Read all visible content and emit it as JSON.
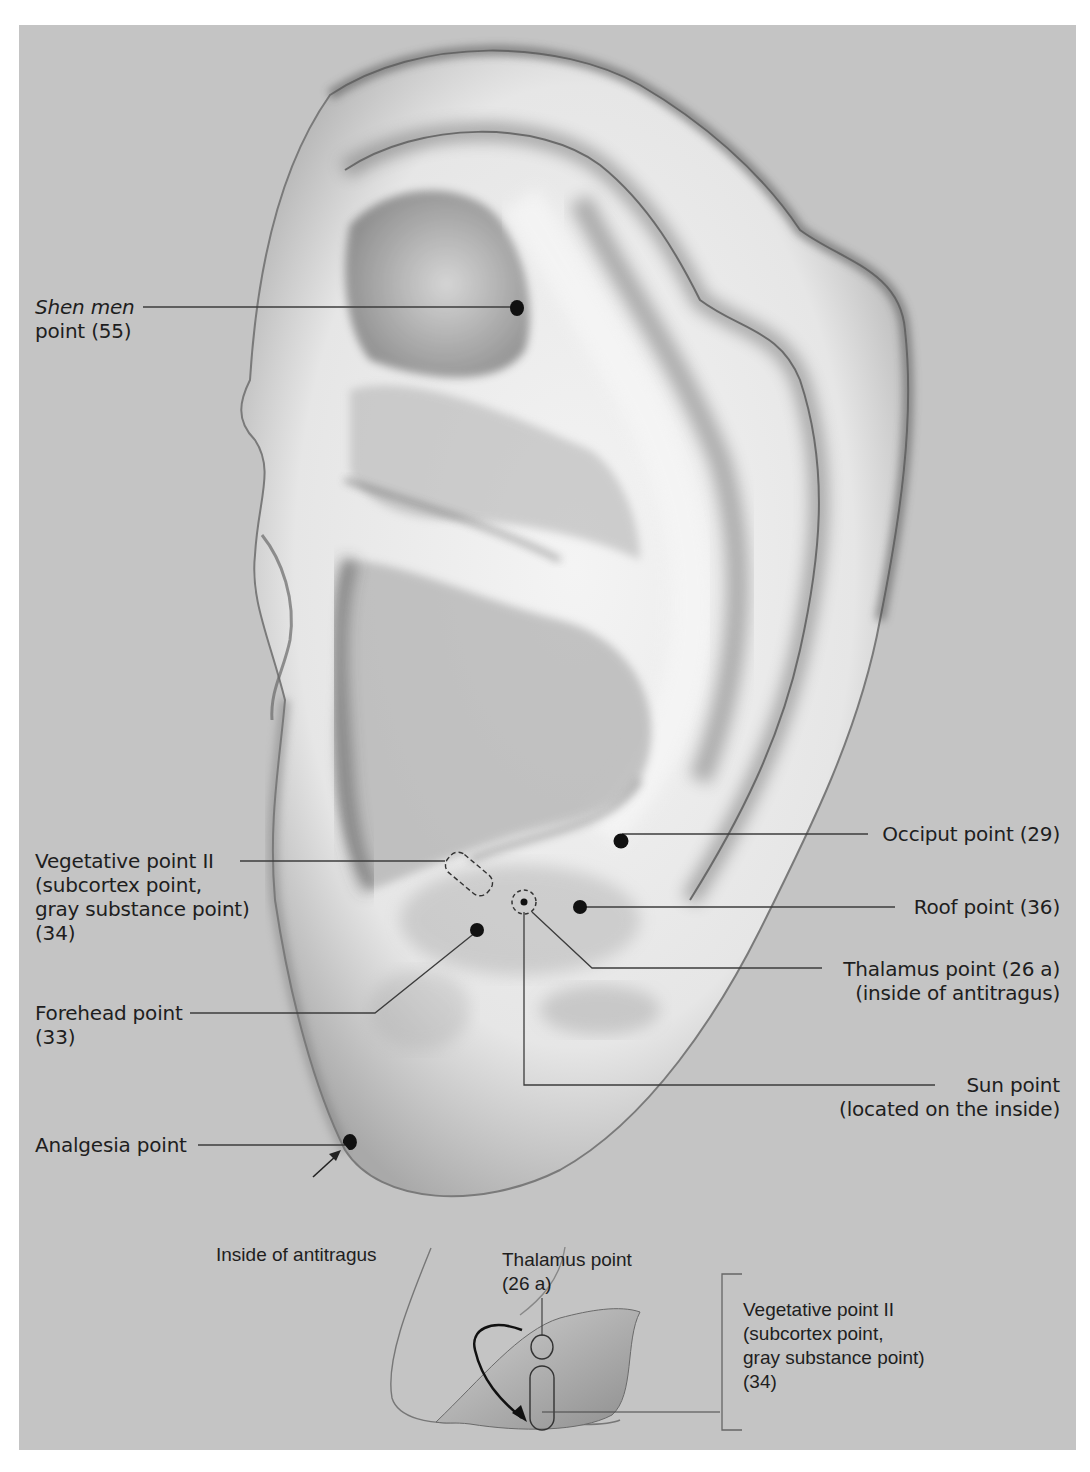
{
  "figure": {
    "background_color": "#c4c4c4",
    "points": [
      {
        "id": "shen-men",
        "label_line1_italic": "Shen men",
        "label_line2": "point (55)"
      },
      {
        "id": "vegetative-ii",
        "lines": [
          "Vegetative point II",
          "(subcortex point,",
          "gray substance point)",
          "(34)"
        ]
      },
      {
        "id": "forehead",
        "lines": [
          "Forehead point",
          "(33)"
        ]
      },
      {
        "id": "analgesia",
        "lines": [
          "Analgesia point"
        ]
      },
      {
        "id": "occiput",
        "lines": [
          "Occiput point (29)"
        ]
      },
      {
        "id": "roof",
        "lines": [
          "Roof point (36)"
        ]
      },
      {
        "id": "thalamus",
        "lines": [
          "Thalamus point (26 a)",
          "(inside of antitragus)"
        ]
      },
      {
        "id": "sun",
        "lines": [
          "Sun point",
          "(located on the inside)"
        ]
      }
    ]
  },
  "inset": {
    "title": "Inside of antitragus",
    "thalamus": [
      "Thalamus point",
      "(26 a)"
    ],
    "vegetative": [
      "Vegetative point II",
      "(subcortex point,",
      "gray substance point)",
      "(34)"
    ]
  }
}
